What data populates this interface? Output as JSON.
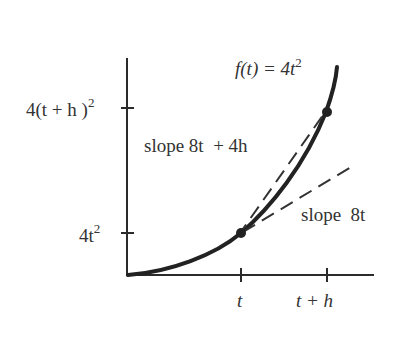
{
  "diagram": {
    "function_label": {
      "prefix": "f(t) = 4t",
      "sup": "2"
    },
    "y_ticks": [
      {
        "main": "4(t + h )",
        "sup": "2"
      },
      {
        "main": "4t",
        "sup": "2"
      }
    ],
    "x_ticks": [
      {
        "label": "t"
      },
      {
        "label": "t + h"
      }
    ],
    "secant_label": "slope 8t  + 4h",
    "tangent_label": "slope  8t",
    "colors": {
      "ink": "#2b2b2b",
      "background": "#ffffff"
    }
  }
}
